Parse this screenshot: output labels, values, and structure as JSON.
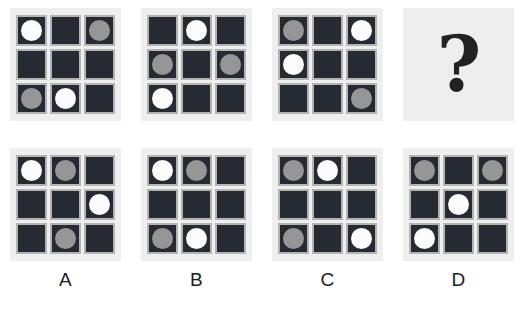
{
  "colors": {
    "page_background": "#ffffff",
    "panel_background": "#efefef",
    "cell_fill": "#262a33",
    "cell_border": "#b4b4b4",
    "disc_white": "#fbfbfb",
    "disc_gray": "#969696",
    "label_text": "#1c1c1c",
    "question_mark": "#222222"
  },
  "sequence": {
    "panels": [
      {
        "name": "sequence-panel-1",
        "cells": [
          "white",
          "empty",
          "gray",
          "empty",
          "empty",
          "empty",
          "gray",
          "white",
          "empty"
        ]
      },
      {
        "name": "sequence-panel-2",
        "cells": [
          "empty",
          "white",
          "empty",
          "gray",
          "empty",
          "gray",
          "white",
          "empty",
          "empty"
        ]
      },
      {
        "name": "sequence-panel-3",
        "cells": [
          "gray",
          "empty",
          "white",
          "white",
          "empty",
          "empty",
          "empty",
          "empty",
          "gray"
        ]
      }
    ],
    "missing_panel": {
      "name": "question-panel",
      "icon": "question-mark-icon",
      "glyph": "?"
    }
  },
  "options": [
    {
      "name": "option-a",
      "label": "A",
      "cells": [
        "white",
        "gray",
        "empty",
        "empty",
        "empty",
        "white",
        "empty",
        "gray",
        "empty"
      ]
    },
    {
      "name": "option-b",
      "label": "B",
      "cells": [
        "white",
        "gray",
        "empty",
        "empty",
        "empty",
        "empty",
        "gray",
        "white",
        "empty"
      ]
    },
    {
      "name": "option-c",
      "label": "C",
      "cells": [
        "gray",
        "white",
        "empty",
        "empty",
        "empty",
        "empty",
        "gray",
        "empty",
        "white"
      ]
    },
    {
      "name": "option-d",
      "label": "D",
      "cells": [
        "gray",
        "empty",
        "gray",
        "empty",
        "white",
        "empty",
        "white",
        "empty",
        "empty"
      ]
    }
  ]
}
